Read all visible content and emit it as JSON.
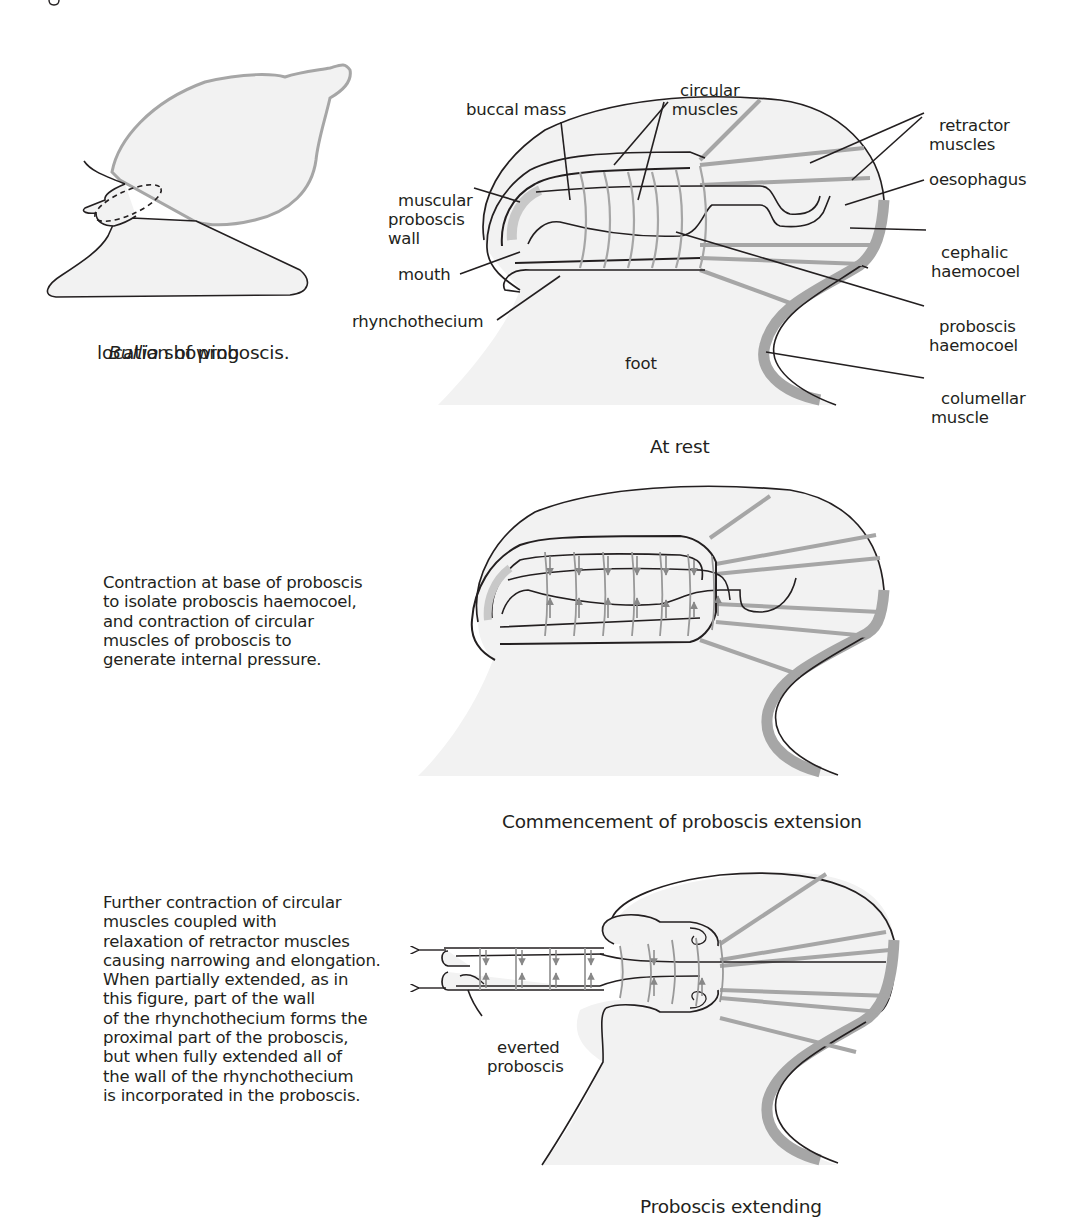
{
  "figure": {
    "colors": {
      "ink": "#231f20",
      "muscle_gray": "#a6a6a6",
      "body_fill": "#f2f2f2",
      "background": "#ffffff"
    },
    "inset": {
      "caption_italic": "Bullia",
      "caption_rest": " showing",
      "caption_line2": "location of proboscis."
    },
    "panel_rest": {
      "caption": "At rest",
      "labels": {
        "circular_muscles_1": "circular",
        "circular_muscles_2": "muscles",
        "buccal_mass": "buccal mass",
        "muscular_proboscis_wall_1": "muscular",
        "muscular_proboscis_wall_2": "proboscis",
        "muscular_proboscis_wall_3": "wall",
        "mouth": "mouth",
        "rhynchothecium": "rhynchothecium",
        "foot": "foot",
        "retractor_muscles_1": "retractor",
        "retractor_muscles_2": "muscles",
        "oesophagus": "oesophagus",
        "cephalic_haemocoel_1": "cephalic",
        "cephalic_haemocoel_2": "haemocoel",
        "proboscis_haemocoel_1": "proboscis",
        "proboscis_haemocoel_2": "haemocoel",
        "columellar_muscle_1": "columellar",
        "columellar_muscle_2": "muscle"
      }
    },
    "panel_commencement": {
      "caption": "Commencement of proboscis extension",
      "description": [
        "Contraction at base of proboscis",
        "to isolate proboscis haemocoel,",
        "and contraction of circular",
        "muscles of proboscis to",
        "generate internal pressure."
      ]
    },
    "panel_extending": {
      "caption": "Proboscis extending",
      "labels": {
        "everted_proboscis_1": "everted",
        "everted_proboscis_2": "proboscis"
      },
      "description": [
        "Further contraction of circular",
        "muscles coupled with",
        "relaxation of retractor muscles",
        "causing narrowing and elongation.",
        "When partially extended, as in",
        "this figure, part of the wall",
        "of the rhynchothecium forms the",
        "proximal part of the proboscis,",
        "but when fully extended all of",
        "the wall of the rhynchothecium",
        "is incorporated in the proboscis."
      ]
    }
  }
}
